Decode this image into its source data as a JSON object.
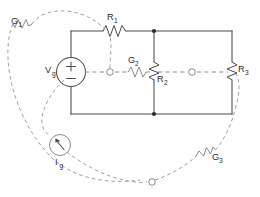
{
  "diagram": {
    "primal_label": "solid network",
    "dual_label": "dashed network",
    "colors": {
      "solid_wire": "#4a4a4a",
      "dashed_wire": "#8c8c8c",
      "node_dot": "#2b2b2b",
      "background": "#ffffff",
      "label_text": "#2b2b2b"
    }
  },
  "components": {
    "vg": {
      "name": "Vg",
      "base": "V",
      "sub": "g",
      "type": "voltage-source",
      "plus": "+",
      "minus": "−"
    },
    "ig": {
      "name": "Ig",
      "base": "I",
      "sub": "g",
      "type": "current-source"
    },
    "r1": {
      "name": "R1",
      "base": "R",
      "sub": "1",
      "type": "resistor",
      "orientation": "horizontal"
    },
    "r2": {
      "name": "R2",
      "base": "R",
      "sub": "2",
      "type": "resistor",
      "orientation": "vertical"
    },
    "r3": {
      "name": "R3",
      "base": "R",
      "sub": "3",
      "type": "resistor",
      "orientation": "vertical"
    },
    "g1": {
      "name": "G1",
      "base": "G",
      "sub": "1",
      "type": "conductance",
      "orientation": "diagonal"
    },
    "g2": {
      "name": "G2",
      "base": "G",
      "sub": "2",
      "type": "conductance",
      "orientation": "horizontal"
    },
    "g3": {
      "name": "G3",
      "base": "G",
      "sub": "3",
      "type": "conductance",
      "orientation": "diagonal"
    }
  },
  "nodes": {
    "junction_top": {
      "label": "",
      "kind": "solid-dot"
    },
    "junction_bottom": {
      "label": "",
      "kind": "solid-dot"
    },
    "dual_node_a": {
      "label": "",
      "kind": "open-ring"
    },
    "dual_node_b": {
      "label": "",
      "kind": "open-ring"
    },
    "dual_node_outer": {
      "label": "",
      "kind": "open-ring"
    }
  }
}
